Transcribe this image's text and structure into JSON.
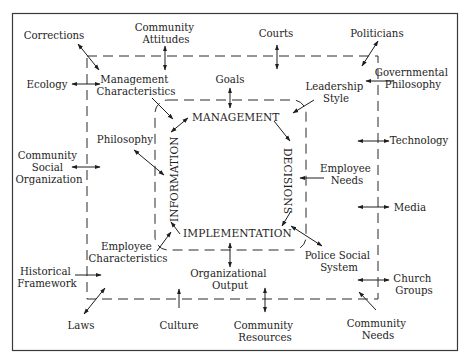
{
  "diagram": {
    "type": "environmental-systems-diagram",
    "colors": {
      "text": "#1e1e1e",
      "line": "#2a2a2a",
      "background": "#ffffff"
    },
    "core_loop": {
      "top": "MANAGEMENT",
      "right": "DECISIONS",
      "bottom": "IMPLEMENTATION",
      "left": "INFORMATION"
    },
    "inner_factors": {
      "management_characteristics": [
        "Management",
        "Characteristics"
      ],
      "goals": "Goals",
      "leadership_style": [
        "Leadership",
        "Style"
      ],
      "philosophy": "Philosophy",
      "employee_needs": [
        "Employee",
        "Needs"
      ],
      "employee_characteristics": [
        "Employee",
        "Characteristics"
      ],
      "organizational_output": [
        "Organizational",
        "Output"
      ],
      "police_social_system": [
        "Police Social",
        "System"
      ]
    },
    "outer_factors": {
      "corrections": "Corrections",
      "community_attitudes": [
        "Community",
        "Attitudes"
      ],
      "courts": "Courts",
      "politicians": "Politicians",
      "ecology": "Ecology",
      "governmental_philosophy": [
        "Governmental",
        "Philosophy"
      ],
      "technology": "Technology",
      "community_social_organization": [
        "Community",
        "Social",
        "Organization"
      ],
      "media": "Media",
      "historical_framework": [
        "Historical",
        "Framework"
      ],
      "church_groups": [
        "Church",
        "Groups"
      ],
      "laws": "Laws",
      "culture": "Culture",
      "community_resources": [
        "Community",
        "Resources"
      ],
      "community_needs": [
        "Community",
        "Needs"
      ]
    }
  }
}
